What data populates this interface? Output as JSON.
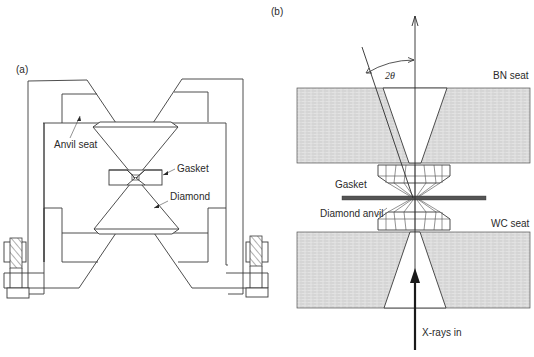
{
  "figure": {
    "panel_a": {
      "label": "(a)",
      "annotations": {
        "anvil_seat": "Anvil seat",
        "gasket": "Gasket",
        "diamond": "Diamond"
      }
    },
    "panel_b": {
      "label": "(b)",
      "annotations": {
        "bn_seat": "BN seat",
        "wc_seat": "WC seat",
        "gasket": "Gasket",
        "diamond_anvil": "Diamond anvil",
        "xrays_in": "X-rays in",
        "angle": "2θ"
      }
    },
    "colors": {
      "line": "#3a3a3a",
      "seat_fill": "#d8d8d8",
      "gasket_fill": "#555555",
      "background": "#ffffff"
    }
  }
}
